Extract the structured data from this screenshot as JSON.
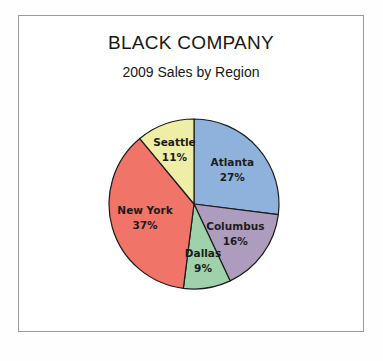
{
  "chart_data": {
    "type": "pie",
    "title": "BLACK COMPANY",
    "subtitle": "2009 Sales by Region",
    "xlabel": "",
    "ylabel": "",
    "legend": "none",
    "grid": false,
    "start_angle_deg": 0,
    "direction": "clockwise",
    "categories": [
      "Atlanta",
      "Columbus",
      "Dallas",
      "New York",
      "Seattle"
    ],
    "values": [
      27,
      16,
      9,
      37,
      11
    ],
    "value_unit": "%",
    "value_labels": [
      "27%",
      "16%",
      "9%",
      "37%",
      "11%"
    ],
    "colors": [
      "#8FB2DC",
      "#AE9CBE",
      "#9FD2AB",
      "#F07468",
      "#EEEEA6"
    ],
    "slices": [
      {
        "label": "Atlanta",
        "value": 27,
        "value_label": "27%",
        "color": "#8FB2DC"
      },
      {
        "label": "Columbus",
        "value": 16,
        "value_label": "16%",
        "color": "#AE9CBE"
      },
      {
        "label": "Dallas",
        "value": 9,
        "value_label": "9%",
        "color": "#9FD2AB"
      },
      {
        "label": "New York",
        "value": 37,
        "value_label": "37%",
        "color": "#F07468"
      },
      {
        "label": "Seattle",
        "value": 11,
        "value_label": "11%",
        "color": "#EEEEA6"
      }
    ],
    "outline_color": "#1b1b1b",
    "frame_color": "#9a9a9a",
    "background_color": "#ffffff"
  }
}
